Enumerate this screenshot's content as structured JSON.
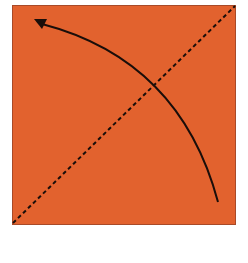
{
  "diagram": {
    "type": "origami-fold-step",
    "paper_color": "#e2622e",
    "paper_edge_color": "#a84a28",
    "line_color": "#1a0e0a",
    "fold_line": {
      "style": "dashed",
      "from": "bottom-left",
      "to": "top-right"
    },
    "fold_arrow": {
      "from": "bottom-right",
      "to": "top-left",
      "shape": "arc"
    }
  }
}
